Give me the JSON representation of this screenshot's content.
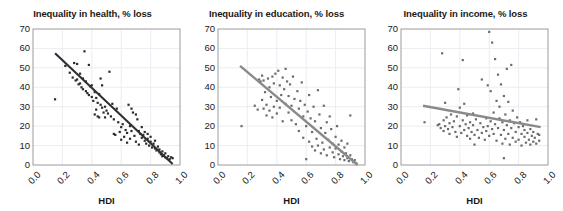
{
  "figure": {
    "background": "#ffffff",
    "panel_count": 3
  },
  "chart_data": [
    {
      "type": "scatter",
      "title": "Inequality in health, % loss",
      "xlabel": "HDI",
      "ylabel": "",
      "xlim": [
        0.0,
        1.0
      ],
      "ylim": [
        0,
        70
      ],
      "xticks": [
        "0.0",
        "0.2",
        "0.4",
        "0.6",
        "0.8",
        "1.0"
      ],
      "yticks": [
        "0",
        "10",
        "20",
        "30",
        "40",
        "50",
        "60",
        "70"
      ],
      "grid": true,
      "legend": "none",
      "marker_color": "#2a2a2a",
      "trend_color": "#2f2f2f",
      "trendline": {
        "x": [
          0.15,
          0.95
        ],
        "y": [
          57.5,
          0.5
        ]
      },
      "points": [
        [
          0.15,
          33.8
        ],
        [
          0.22,
          51.0
        ],
        [
          0.25,
          47.5
        ],
        [
          0.27,
          45.0
        ],
        [
          0.28,
          52.5
        ],
        [
          0.29,
          43.5
        ],
        [
          0.3,
          44.0
        ],
        [
          0.3,
          52.0
        ],
        [
          0.31,
          41.5
        ],
        [
          0.32,
          42.0
        ],
        [
          0.32,
          47.0
        ],
        [
          0.33,
          40.0
        ],
        [
          0.34,
          44.5
        ],
        [
          0.34,
          39.0
        ],
        [
          0.35,
          58.5
        ],
        [
          0.36,
          38.0
        ],
        [
          0.36,
          43.0
        ],
        [
          0.37,
          37.0
        ],
        [
          0.38,
          51.5
        ],
        [
          0.38,
          36.0
        ],
        [
          0.39,
          40.5
        ],
        [
          0.4,
          35.0
        ],
        [
          0.4,
          41.0
        ],
        [
          0.41,
          33.0
        ],
        [
          0.42,
          37.5
        ],
        [
          0.42,
          26.0
        ],
        [
          0.43,
          34.5
        ],
        [
          0.43,
          28.5
        ],
        [
          0.44,
          32.0
        ],
        [
          0.44,
          25.0
        ],
        [
          0.45,
          36.5
        ],
        [
          0.45,
          24.5
        ],
        [
          0.46,
          31.0
        ],
        [
          0.46,
          44.5
        ],
        [
          0.47,
          29.5
        ],
        [
          0.47,
          41.0
        ],
        [
          0.48,
          27.0
        ],
        [
          0.49,
          30.0
        ],
        [
          0.49,
          24.5
        ],
        [
          0.5,
          28.0
        ],
        [
          0.51,
          26.5
        ],
        [
          0.52,
          48.0
        ],
        [
          0.53,
          25.0
        ],
        [
          0.54,
          31.5
        ],
        [
          0.55,
          16.0
        ],
        [
          0.55,
          23.5
        ],
        [
          0.56,
          15.5
        ],
        [
          0.57,
          29.0
        ],
        [
          0.58,
          22.0
        ],
        [
          0.59,
          17.0
        ],
        [
          0.6,
          19.5
        ],
        [
          0.6,
          13.0
        ],
        [
          0.61,
          21.0
        ],
        [
          0.62,
          14.5
        ],
        [
          0.63,
          18.0
        ],
        [
          0.64,
          16.5
        ],
        [
          0.64,
          11.5
        ],
        [
          0.65,
          31.0
        ],
        [
          0.66,
          20.0
        ],
        [
          0.66,
          13.5
        ],
        [
          0.67,
          29.0
        ],
        [
          0.67,
          17.5
        ],
        [
          0.68,
          27.0
        ],
        [
          0.69,
          15.0
        ],
        [
          0.7,
          26.0
        ],
        [
          0.7,
          12.0
        ],
        [
          0.71,
          23.5
        ],
        [
          0.72,
          17.5
        ],
        [
          0.72,
          10.5
        ],
        [
          0.73,
          16.0
        ],
        [
          0.74,
          14.0
        ],
        [
          0.74,
          19.5
        ],
        [
          0.75,
          15.5
        ],
        [
          0.76,
          12.5
        ],
        [
          0.76,
          17.0
        ],
        [
          0.77,
          11.0
        ],
        [
          0.78,
          13.5
        ],
        [
          0.78,
          16.0
        ],
        [
          0.79,
          10.0
        ],
        [
          0.8,
          12.0
        ],
        [
          0.8,
          14.5
        ],
        [
          0.81,
          9.0
        ],
        [
          0.82,
          11.0
        ],
        [
          0.83,
          8.5
        ],
        [
          0.83,
          12.5
        ],
        [
          0.84,
          7.5
        ],
        [
          0.85,
          9.5
        ],
        [
          0.86,
          6.5
        ],
        [
          0.86,
          8.0
        ],
        [
          0.87,
          5.5
        ],
        [
          0.88,
          7.0
        ],
        [
          0.88,
          4.5
        ],
        [
          0.89,
          5.0
        ],
        [
          0.9,
          4.0
        ],
        [
          0.9,
          6.0
        ],
        [
          0.91,
          3.5
        ],
        [
          0.92,
          4.5
        ],
        [
          0.93,
          3.0
        ],
        [
          0.94,
          4.0
        ],
        [
          0.95,
          3.5
        ]
      ]
    },
    {
      "type": "scatter",
      "title": "Inequality in education, % loss",
      "xlabel": "HDI",
      "ylabel": "",
      "xlim": [
        0.0,
        1.0
      ],
      "ylim": [
        0,
        70
      ],
      "xticks": [
        "0.0",
        "0.2",
        "0.4",
        "0.6",
        "0.8",
        "1.0"
      ],
      "yticks": [
        "0",
        "10",
        "20",
        "30",
        "40",
        "50",
        "60",
        "70"
      ],
      "grid": true,
      "legend": "none",
      "marker_color": "#6b6b6b",
      "trend_color": "#8a8a8a",
      "trendline": {
        "x": [
          0.15,
          0.95
        ],
        "y": [
          51.0,
          0.0
        ]
      },
      "points": [
        [
          0.16,
          20.0
        ],
        [
          0.25,
          30.5
        ],
        [
          0.27,
          28.5
        ],
        [
          0.28,
          44.0
        ],
        [
          0.29,
          43.0
        ],
        [
          0.3,
          46.0
        ],
        [
          0.3,
          33.5
        ],
        [
          0.31,
          29.0
        ],
        [
          0.31,
          43.5
        ],
        [
          0.32,
          37.5
        ],
        [
          0.33,
          31.0
        ],
        [
          0.33,
          25.5
        ],
        [
          0.34,
          44.5
        ],
        [
          0.35,
          40.0
        ],
        [
          0.35,
          28.0
        ],
        [
          0.36,
          35.0
        ],
        [
          0.37,
          45.5
        ],
        [
          0.37,
          24.5
        ],
        [
          0.38,
          42.0
        ],
        [
          0.38,
          30.0
        ],
        [
          0.39,
          47.0
        ],
        [
          0.4,
          33.0
        ],
        [
          0.4,
          26.5
        ],
        [
          0.41,
          48.5
        ],
        [
          0.42,
          41.0
        ],
        [
          0.42,
          29.5
        ],
        [
          0.43,
          36.0
        ],
        [
          0.44,
          45.0
        ],
        [
          0.44,
          22.5
        ],
        [
          0.45,
          39.0
        ],
        [
          0.46,
          49.5
        ],
        [
          0.46,
          31.5
        ],
        [
          0.47,
          43.0
        ],
        [
          0.48,
          27.0
        ],
        [
          0.48,
          35.5
        ],
        [
          0.49,
          41.5
        ],
        [
          0.5,
          23.0
        ],
        [
          0.5,
          30.5
        ],
        [
          0.51,
          45.5
        ],
        [
          0.52,
          34.0
        ],
        [
          0.53,
          21.0
        ],
        [
          0.54,
          38.0
        ],
        [
          0.55,
          29.0
        ],
        [
          0.55,
          17.5
        ],
        [
          0.56,
          33.0
        ],
        [
          0.57,
          42.5
        ],
        [
          0.58,
          25.0
        ],
        [
          0.58,
          14.0
        ],
        [
          0.59,
          31.0
        ],
        [
          0.6,
          20.0
        ],
        [
          0.6,
          3.0
        ],
        [
          0.61,
          27.5
        ],
        [
          0.62,
          12.0
        ],
        [
          0.62,
          36.0
        ],
        [
          0.63,
          24.0
        ],
        [
          0.64,
          9.5
        ],
        [
          0.64,
          17.0
        ],
        [
          0.65,
          30.0
        ],
        [
          0.66,
          7.5
        ],
        [
          0.66,
          22.5
        ],
        [
          0.67,
          13.5
        ],
        [
          0.68,
          38.5
        ],
        [
          0.68,
          10.0
        ],
        [
          0.69,
          26.0
        ],
        [
          0.7,
          19.0
        ],
        [
          0.7,
          6.0
        ],
        [
          0.71,
          11.5
        ],
        [
          0.72,
          30.5
        ],
        [
          0.72,
          8.0
        ],
        [
          0.73,
          16.5
        ],
        [
          0.74,
          22.0
        ],
        [
          0.74,
          5.0
        ],
        [
          0.75,
          13.0
        ],
        [
          0.76,
          9.0
        ],
        [
          0.76,
          25.0
        ],
        [
          0.77,
          18.5
        ],
        [
          0.78,
          6.5
        ],
        [
          0.78,
          11.0
        ],
        [
          0.79,
          4.0
        ],
        [
          0.8,
          14.5
        ],
        [
          0.8,
          8.5
        ],
        [
          0.81,
          20.0
        ],
        [
          0.82,
          5.5
        ],
        [
          0.82,
          10.5
        ],
        [
          0.83,
          3.0
        ],
        [
          0.84,
          7.0
        ],
        [
          0.84,
          12.5
        ],
        [
          0.85,
          4.5
        ],
        [
          0.86,
          2.5
        ],
        [
          0.86,
          9.0
        ],
        [
          0.87,
          6.0
        ],
        [
          0.88,
          3.5
        ],
        [
          0.88,
          11.0
        ],
        [
          0.89,
          2.0
        ],
        [
          0.9,
          5.0
        ],
        [
          0.9,
          25.5
        ],
        [
          0.91,
          3.0
        ],
        [
          0.92,
          1.5
        ],
        [
          0.93,
          2.5
        ],
        [
          0.94,
          1.0
        ]
      ]
    },
    {
      "type": "scatter",
      "title": "Inequality in income, % loss",
      "xlabel": "HDI",
      "ylabel": "",
      "xlim": [
        0.0,
        1.0
      ],
      "ylim": [
        0,
        70
      ],
      "xticks": [
        "0.0",
        "0.2",
        "0.4",
        "0.6",
        "0.8",
        "1.0"
      ],
      "yticks": [
        "0",
        "10",
        "20",
        "30",
        "40",
        "50",
        "60",
        "70"
      ],
      "grid": true,
      "legend": "none",
      "marker_color": "#6b6b6b",
      "trend_color": "#8a8a8a",
      "trendline": {
        "x": [
          0.15,
          0.95
        ],
        "y": [
          30.5,
          19.5
        ]
      },
      "points": [
        [
          0.16,
          22.0
        ],
        [
          0.25,
          20.5
        ],
        [
          0.26,
          21.0
        ],
        [
          0.27,
          19.0
        ],
        [
          0.28,
          57.5
        ],
        [
          0.29,
          23.0
        ],
        [
          0.29,
          17.5
        ],
        [
          0.3,
          32.0
        ],
        [
          0.3,
          20.0
        ],
        [
          0.31,
          24.5
        ],
        [
          0.32,
          18.5
        ],
        [
          0.33,
          21.5
        ],
        [
          0.33,
          16.0
        ],
        [
          0.34,
          26.0
        ],
        [
          0.35,
          19.5
        ],
        [
          0.36,
          22.5
        ],
        [
          0.37,
          17.0
        ],
        [
          0.38,
          25.0
        ],
        [
          0.38,
          14.5
        ],
        [
          0.39,
          39.0
        ],
        [
          0.4,
          20.0
        ],
        [
          0.4,
          29.5
        ],
        [
          0.41,
          16.5
        ],
        [
          0.42,
          23.0
        ],
        [
          0.42,
          54.0
        ],
        [
          0.43,
          18.0
        ],
        [
          0.43,
          31.5
        ],
        [
          0.44,
          21.0
        ],
        [
          0.45,
          15.0
        ],
        [
          0.45,
          25.5
        ],
        [
          0.46,
          19.0
        ],
        [
          0.47,
          13.5
        ],
        [
          0.47,
          22.0
        ],
        [
          0.48,
          17.0
        ],
        [
          0.49,
          26.5
        ],
        [
          0.49,
          20.5
        ],
        [
          0.5,
          10.5
        ],
        [
          0.5,
          15.5
        ],
        [
          0.51,
          23.5
        ],
        [
          0.52,
          18.0
        ],
        [
          0.53,
          14.0
        ],
        [
          0.54,
          21.5
        ],
        [
          0.55,
          16.5
        ],
        [
          0.55,
          44.0
        ],
        [
          0.56,
          19.5
        ],
        [
          0.57,
          13.0
        ],
        [
          0.58,
          24.0
        ],
        [
          0.58,
          17.5
        ],
        [
          0.59,
          41.0
        ],
        [
          0.59,
          20.0
        ],
        [
          0.6,
          15.0
        ],
        [
          0.6,
          68.5
        ],
        [
          0.61,
          22.5
        ],
        [
          0.61,
          38.0
        ],
        [
          0.62,
          18.5
        ],
        [
          0.62,
          63.0
        ],
        [
          0.63,
          27.0
        ],
        [
          0.63,
          16.0
        ],
        [
          0.64,
          21.0
        ],
        [
          0.64,
          54.5
        ],
        [
          0.65,
          33.0
        ],
        [
          0.65,
          12.5
        ],
        [
          0.66,
          19.0
        ],
        [
          0.66,
          46.5
        ],
        [
          0.67,
          30.0
        ],
        [
          0.67,
          24.0
        ],
        [
          0.68,
          15.5
        ],
        [
          0.68,
          41.5
        ],
        [
          0.69,
          22.0
        ],
        [
          0.69,
          11.0
        ],
        [
          0.7,
          35.5
        ],
        [
          0.7,
          18.0
        ],
        [
          0.7,
          3.5
        ],
        [
          0.71,
          26.0
        ],
        [
          0.71,
          13.5
        ],
        [
          0.72,
          49.5
        ],
        [
          0.72,
          20.5
        ],
        [
          0.73,
          32.5
        ],
        [
          0.73,
          16.0
        ],
        [
          0.74,
          23.0
        ],
        [
          0.74,
          10.5
        ],
        [
          0.75,
          51.5
        ],
        [
          0.75,
          19.0
        ],
        [
          0.76,
          28.0
        ],
        [
          0.76,
          14.0
        ],
        [
          0.77,
          21.5
        ],
        [
          0.78,
          12.0
        ],
        [
          0.78,
          17.0
        ],
        [
          0.79,
          24.5
        ],
        [
          0.8,
          19.5
        ],
        [
          0.8,
          13.0
        ],
        [
          0.81,
          22.0
        ],
        [
          0.82,
          16.0
        ],
        [
          0.82,
          10.0
        ],
        [
          0.83,
          20.0
        ],
        [
          0.84,
          14.5
        ],
        [
          0.84,
          18.0
        ],
        [
          0.85,
          11.5
        ],
        [
          0.86,
          16.5
        ],
        [
          0.86,
          23.0
        ],
        [
          0.87,
          13.0
        ],
        [
          0.88,
          18.5
        ],
        [
          0.88,
          10.5
        ],
        [
          0.89,
          15.0
        ],
        [
          0.9,
          12.0
        ],
        [
          0.9,
          17.0
        ],
        [
          0.91,
          14.0
        ],
        [
          0.92,
          23.5
        ],
        [
          0.92,
          11.0
        ],
        [
          0.93,
          16.0
        ],
        [
          0.94,
          12.5
        ],
        [
          0.94,
          15.5
        ]
      ]
    }
  ]
}
